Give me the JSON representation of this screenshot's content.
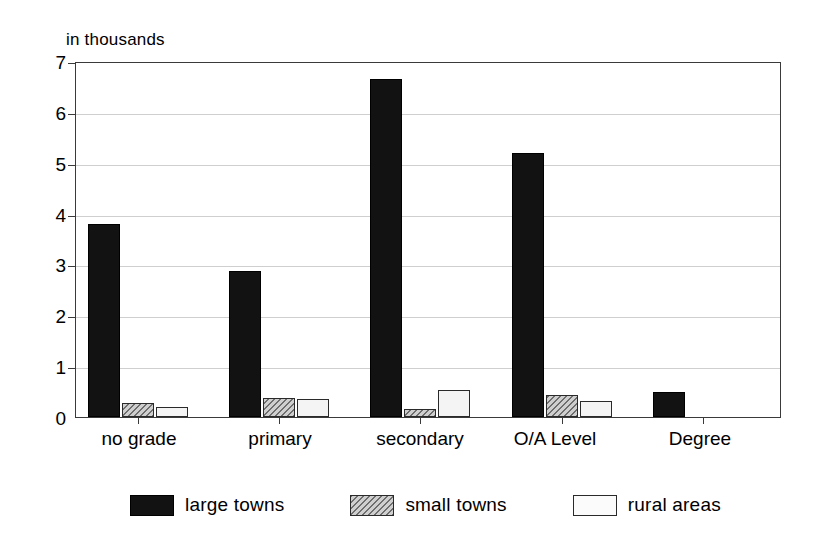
{
  "chart_data": {
    "type": "bar",
    "title": "",
    "subtitle": "",
    "axis_caption": "in thousands",
    "xlabel": "",
    "ylabel": "",
    "categories": [
      "no grade",
      "primary",
      "secondary",
      "O/A Level",
      "Degree"
    ],
    "series": [
      {
        "name": "large towns",
        "values": [
          3.8,
          2.87,
          6.65,
          5.2,
          0.5
        ],
        "color": "#121212",
        "pattern": "solid"
      },
      {
        "name": "small towns",
        "values": [
          0.28,
          0.37,
          0.16,
          0.43,
          0.0
        ],
        "color": "#cfcfcf",
        "pattern": "diagonal-hatch"
      },
      {
        "name": "rural areas",
        "values": [
          0.19,
          0.36,
          0.53,
          0.32,
          0.0
        ],
        "color": "#f4f4f4",
        "pattern": "empty"
      }
    ],
    "ylim": [
      0,
      7
    ],
    "ytick_labels": [
      "0",
      "1",
      "2",
      "3",
      "4",
      "5",
      "6",
      "7"
    ],
    "ytick_values": [
      0,
      1,
      2,
      3,
      4,
      5,
      6,
      7
    ],
    "grid": true,
    "grid_axis": "y",
    "legend_position": "bottom",
    "frame": true
  },
  "legend": {
    "items": [
      {
        "label": "large towns"
      },
      {
        "label": "small towns"
      },
      {
        "label": "rural areas"
      }
    ]
  }
}
